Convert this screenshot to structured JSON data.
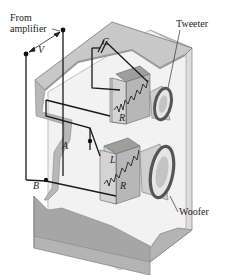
{
  "labels": {
    "source_line1": "From",
    "source_line2": "amplifier",
    "voltage": "V",
    "capacitor": "C",
    "tweeter": "Tweeter",
    "woofer": "Woofer",
    "resistor_top": "R",
    "inductor": "L",
    "resistor_bottom": "R",
    "node_a": "A",
    "node_b": "B"
  },
  "colors": {
    "background": "#ffffff",
    "cabinet_light": "#ebebeb",
    "cabinet_mid": "#c8c8c8",
    "cabinet_dark": "#a9a9a9",
    "wire": "#1a1a1a",
    "box_front": "#d2d2d2",
    "box_top": "#9e9e9e",
    "speaker_ring": "#555555"
  }
}
